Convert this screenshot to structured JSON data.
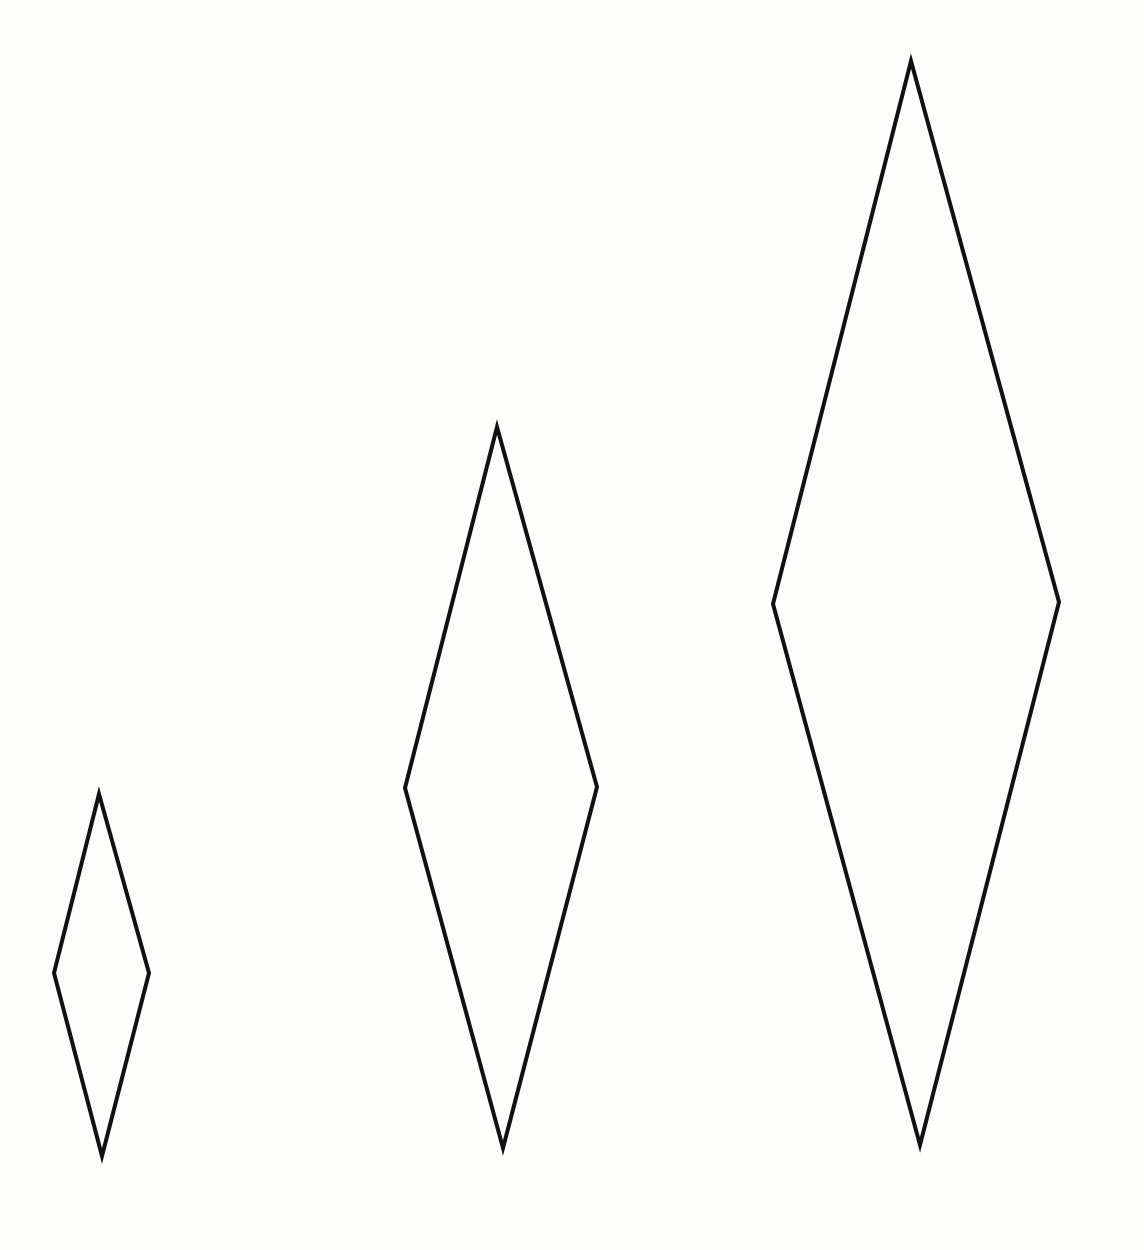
{
  "canvas": {
    "width": 1144,
    "height": 1250,
    "background": "#fdfdfc",
    "stroke_color": "#111111",
    "stroke_width": 4
  },
  "shapes": [
    {
      "name": "small-diamond",
      "type": "rhombus",
      "points": [
        [
          99,
          794
        ],
        [
          149,
          973
        ],
        [
          102,
          1156
        ],
        [
          54,
          973
        ]
      ]
    },
    {
      "name": "medium-diamond",
      "type": "rhombus",
      "points": [
        [
          497,
          427
        ],
        [
          597,
          787
        ],
        [
          503,
          1148
        ],
        [
          405,
          788
        ]
      ]
    },
    {
      "name": "large-diamond",
      "type": "rhombus",
      "points": [
        [
          911,
          61
        ],
        [
          1059,
          602
        ],
        [
          920,
          1145
        ],
        [
          773,
          604
        ]
      ]
    }
  ]
}
